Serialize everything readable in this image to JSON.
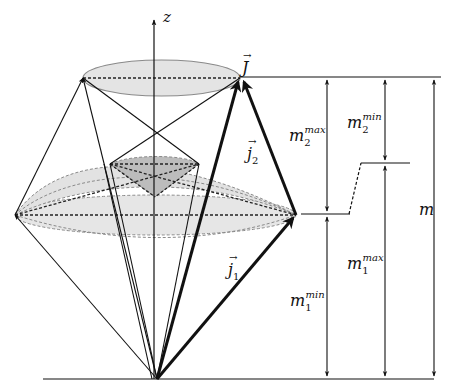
{
  "diagram": {
    "title": "",
    "labels": {
      "z_axis": "z",
      "J_total": "J",
      "j1": "j",
      "j1_sub": "1",
      "j2": "j",
      "j2_sub": "2",
      "m": "m",
      "m1_min": "m",
      "m1_min_sub": "1",
      "m1_min_sup": "min",
      "m1_max": "m",
      "m1_max_sub": "1",
      "m1_max_sup": "max",
      "m2_min": "m",
      "m2_min_sub": "2",
      "m2_min_sup": "min",
      "m2_max": "m",
      "m2_max_sub": "2",
      "m2_max_sup": "max"
    },
    "colors": {
      "stroke": "#111111",
      "ellipse_fill": "#e4e4e4",
      "ellipse_stroke": "#8a8a8a",
      "inner_fill": "#bdbdbd",
      "dash": "#222222"
    }
  }
}
